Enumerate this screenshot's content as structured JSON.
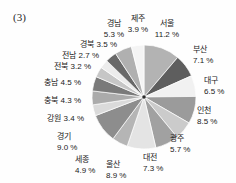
{
  "figure": {
    "label": "(3)"
  },
  "chart_data": {
    "type": "pie",
    "title": "",
    "unit": "%",
    "direction": "clockwise",
    "start_angle_deg": 0,
    "legend": "none",
    "categories": [
      "서울",
      "부산",
      "대구",
      "인천",
      "광주",
      "대전",
      "울산",
      "세종",
      "경기",
      "강원",
      "충북",
      "충남",
      "전북",
      "전남",
      "경북",
      "경남",
      "제주"
    ],
    "values": [
      11.2,
      7.1,
      6.5,
      8.5,
      5.7,
      7.3,
      8.9,
      4.9,
      9.0,
      3.4,
      4.3,
      4.5,
      3.2,
      2.7,
      3.5,
      5.3,
      3.9
    ],
    "slices": [
      {
        "id": "seoul",
        "name": "서울",
        "value": 11.2,
        "display": "11.2 %",
        "color": "#b3b3b3",
        "label": {
          "x": 167,
          "y": 18,
          "align": "center",
          "lines": 2
        }
      },
      {
        "id": "busan",
        "name": "부산",
        "value": 7.1,
        "display": "7.1 %",
        "color": "#5e5e5e",
        "label": {
          "x": 193,
          "y": 44,
          "align": "left",
          "lines": 2
        }
      },
      {
        "id": "daegu",
        "name": "대구",
        "value": 6.5,
        "display": "6.5 %",
        "color": "#f1f1f1",
        "label": {
          "x": 204,
          "y": 75,
          "align": "left",
          "lines": 2
        }
      },
      {
        "id": "incheon",
        "name": "인천",
        "value": 8.5,
        "display": "8.5 %",
        "color": "#9b9b9b",
        "label": {
          "x": 197,
          "y": 105,
          "align": "left",
          "lines": 2
        }
      },
      {
        "id": "gwangju",
        "name": "광주",
        "value": 5.7,
        "display": "5.7 %",
        "color": "#cbcbcb",
        "label": {
          "x": 170,
          "y": 133,
          "align": "left",
          "lines": 2
        }
      },
      {
        "id": "daejeon",
        "name": "대전",
        "value": 7.3,
        "display": "7.3 %",
        "color": "#a1a1a1",
        "label": {
          "x": 143,
          "y": 152,
          "align": "left",
          "lines": 2
        }
      },
      {
        "id": "ulsan",
        "name": "울산",
        "value": 8.9,
        "display": "8.9 %",
        "color": "#e4e4e4",
        "label": {
          "x": 106,
          "y": 159,
          "align": "left",
          "lines": 2
        }
      },
      {
        "id": "sejong",
        "name": "세종",
        "value": 4.9,
        "display": "4.9 %",
        "color": "#b5b5b5",
        "label": {
          "x": 75,
          "y": 154,
          "align": "left",
          "lines": 2
        }
      },
      {
        "id": "gyeonggi",
        "name": "경기",
        "value": 9.0,
        "display": "9.0 %",
        "color": "#8d8d8d",
        "label": {
          "x": 57,
          "y": 131,
          "align": "left",
          "lines": 2
        }
      },
      {
        "id": "gangwon",
        "name": "강원",
        "value": 3.4,
        "display": "3.4 %",
        "color": "#dadada",
        "label": {
          "x": 84,
          "y": 113,
          "align": "right",
          "lines": 1
        }
      },
      {
        "id": "chungbuk",
        "name": "충북",
        "value": 4.3,
        "display": "4.3 %",
        "color": "#ababab",
        "label": {
          "x": 81,
          "y": 95,
          "align": "right",
          "lines": 1
        }
      },
      {
        "id": "chungnam",
        "name": "충남",
        "value": 4.5,
        "display": "4.5 %",
        "color": "#7a7a7a",
        "label": {
          "x": 81,
          "y": 77,
          "align": "right",
          "lines": 1
        }
      },
      {
        "id": "jeonbuk",
        "name": "전북",
        "value": 3.2,
        "display": "3.2 %",
        "color": "#c6c6c6",
        "label": {
          "x": 91,
          "y": 61,
          "align": "right",
          "lines": 1
        }
      },
      {
        "id": "jeonnam",
        "name": "전남",
        "value": 2.7,
        "display": "2.7 %",
        "color": "#ececec",
        "label": {
          "x": 99,
          "y": 50,
          "align": "right",
          "lines": 1
        }
      },
      {
        "id": "gyeongbuk",
        "name": "경북",
        "value": 3.5,
        "display": "3.5 %",
        "color": "#696969",
        "label": {
          "x": 117,
          "y": 39,
          "align": "right",
          "lines": 1
        }
      },
      {
        "id": "gyeongnam",
        "name": "경남",
        "value": 5.3,
        "display": "5.3 %",
        "color": "#b0b0b0",
        "label": {
          "x": 114,
          "y": 18,
          "align": "center",
          "lines": 2
        }
      },
      {
        "id": "jeju",
        "name": "제주",
        "value": 3.9,
        "display": "3.9 %",
        "color": "#f4f4f4",
        "label": {
          "x": 138,
          "y": 13,
          "align": "center",
          "lines": 2
        }
      }
    ]
  }
}
